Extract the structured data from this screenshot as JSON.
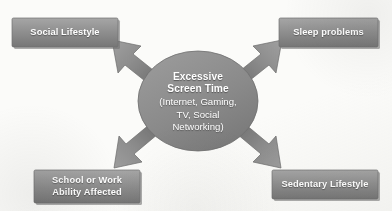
{
  "diagram": {
    "type": "radial-cause-effect",
    "center": {
      "title": "Excessive\nScreen Time",
      "subtitle": "(Internet, Gaming,\nTV, Social\nNetworking)",
      "shape": "ellipse",
      "fill": "#8c8c8c"
    },
    "boxes": [
      {
        "id": "social-lifestyle",
        "label": "Social Lifestyle",
        "position": "top-left",
        "fill": "#8f8f8f"
      },
      {
        "id": "sleep-problems",
        "label": "Sleep problems",
        "position": "top-right",
        "fill": "#8f8f8f"
      },
      {
        "id": "school-or-work",
        "label": "School or Work\nAbility Affected",
        "position": "bottom-left",
        "fill": "#8f8f8f"
      },
      {
        "id": "sedentary-lifestyle",
        "label": "Sedentary Lifestyle",
        "position": "bottom-right",
        "fill": "#8f8f8f"
      }
    ],
    "arrows": [
      {
        "id": "arrow-up-left",
        "direction": "up-left",
        "points_to": "social-lifestyle"
      },
      {
        "id": "arrow-up-right",
        "direction": "up-right",
        "points_to": "sleep-problems"
      },
      {
        "id": "arrow-down-left",
        "direction": "down-left",
        "points_to": "school-or-work"
      },
      {
        "id": "arrow-down-right",
        "direction": "down-right",
        "points_to": "sedentary-lifestyle"
      }
    ],
    "colors": {
      "background": "#fbfbf9",
      "shape_fill_light": "#a3a3a3",
      "shape_fill_dark": "#777777",
      "text": "#ffffff",
      "shadow": "#6e6e6e"
    }
  }
}
